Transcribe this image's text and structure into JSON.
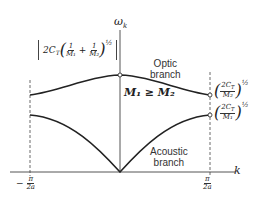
{
  "diagram": {
    "axes": {
      "y_label": "ω_k",
      "x_label": "k",
      "x_left_tick": "−π/2a",
      "x_right_tick": "π/2a"
    },
    "branches": {
      "optic_label_line1": "Optic",
      "optic_label_line2": "branch",
      "acoustic_label_line1": "Acoustic",
      "acoustic_label_line2": "branch"
    },
    "condition": "M₁ ≥ M₂",
    "annotations": {
      "top_bracket": "[2C_T(1/M₁ + 1/M₂)]^½",
      "optic_edge": "(2C_T/M₂)^½",
      "acoustic_edge": "(2C_T/M₁)^½"
    },
    "colors": {
      "line": "#222222",
      "background": "#ffffff"
    }
  }
}
